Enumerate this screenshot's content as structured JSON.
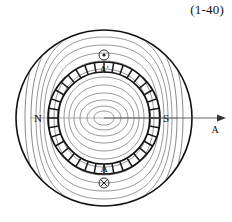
{
  "figure": {
    "equation_label": "(1-40)",
    "title": ""
  },
  "machine": {
    "outer_frame": {
      "name": "stator-frame-outer-circle",
      "cx": 104,
      "cy": 118,
      "r": 88
    },
    "rotor_ring": {
      "name": "rotor-core-ring",
      "cx": 104,
      "cy": 118,
      "r_outer": 56,
      "r_inner": 46,
      "slot_count": 36
    },
    "air_gap_circle": {
      "cx": 104,
      "cy": 118,
      "r": 60
    },
    "pole_labels": [
      {
        "text": "N",
        "x": 38,
        "y": 122,
        "side": "left"
      },
      {
        "text": "S",
        "x": 165,
        "y": 122,
        "side": "right"
      }
    ],
    "coil_markers": [
      {
        "name": "coil-a-prime",
        "label": "A'",
        "symbol": "dot-out-of-page",
        "label_x": 104,
        "label_y": 70,
        "symbol_x": 104,
        "symbol_y": 55,
        "symbol_r": 5
      },
      {
        "name": "coil-a",
        "label": "A",
        "symbol": "cross-into-page",
        "label_x": 104,
        "label_y": 172,
        "symbol_x": 104,
        "symbol_y": 183,
        "symbol_r": 5
      }
    ],
    "axis_arrow": {
      "name": "magnetic-axis-arrow",
      "label": "A",
      "x1": 104,
      "y1": 118,
      "x2": 222,
      "y2": 118,
      "label_x": 214,
      "label_y": 133
    },
    "flux_lines": {
      "name": "magnetic-flux-lines",
      "count_per_pole": 11,
      "color": "#6b6b6b"
    }
  },
  "colors": {
    "ink": "#111111",
    "flux": "#6b6b6b",
    "ring_stroke": "#1a1a1a",
    "background": "#ffffff"
  }
}
